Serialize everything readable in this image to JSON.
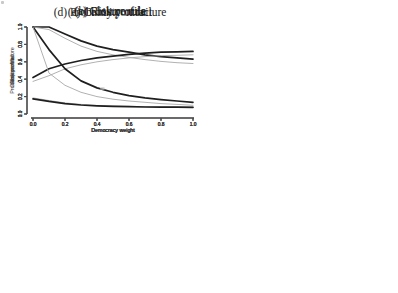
{
  "figure": {
    "background": "#ffffff",
    "axis_color": "#4a4a4a",
    "tick_text_color": "#3d3d3d",
    "title_color": "#1b1b1b",
    "line_colors": {
      "solid_black": "#1f1f1f",
      "thin_gray": "#a8a8a8"
    }
  },
  "chart_data": [
    {
      "type": "line",
      "title": "(a) Closure rule",
      "xlabel": "Democracy weight",
      "ylabel": "Closure rule",
      "xlim": [
        0.0,
        1.0
      ],
      "ylim": [
        0.0,
        1.0
      ],
      "xticks": [
        0.0,
        0.2,
        0.4,
        0.6,
        0.8,
        1.0
      ],
      "yticks": [
        0.0,
        0.2,
        0.4,
        0.6,
        0.8,
        1.0
      ],
      "grid": false,
      "legend": "none",
      "x": [
        0.0,
        0.1,
        0.2,
        0.3,
        0.4,
        0.5,
        0.6,
        0.7,
        0.8,
        0.9,
        1.0
      ],
      "series": [
        {
          "name": "thick-solid",
          "color_key": "solid_black",
          "width": 1.7,
          "values": [
            1.0,
            1.0,
            0.92,
            0.84,
            0.78,
            0.74,
            0.71,
            0.68,
            0.66,
            0.645,
            0.63
          ]
        },
        {
          "name": "thin-gray",
          "color_key": "thin_gray",
          "width": 0.9,
          "values": [
            1.0,
            0.97,
            0.87,
            0.78,
            0.72,
            0.68,
            0.65,
            0.625,
            0.605,
            0.59,
            0.58
          ]
        }
      ]
    },
    {
      "type": "line",
      "title": "(b) Risk profile",
      "xlabel": "Democracy weight",
      "ylabel": "Risk profile",
      "xlim": [
        0.0,
        1.0
      ],
      "ylim": [
        0.0,
        1.0
      ],
      "xticks": [
        0.0,
        0.2,
        0.4,
        0.6,
        0.8,
        1.0
      ],
      "yticks": [
        0.0,
        0.2,
        0.4,
        0.6,
        0.8,
        1.0
      ],
      "grid": false,
      "legend": "none",
      "x": [
        0.0,
        0.1,
        0.2,
        0.3,
        0.4,
        0.5,
        0.6,
        0.7,
        0.8,
        0.9,
        1.0
      ],
      "series": [
        {
          "name": "thick-solid",
          "color_key": "solid_black",
          "width": 1.7,
          "values": [
            0.42,
            0.52,
            0.575,
            0.615,
            0.645,
            0.665,
            0.685,
            0.7,
            0.71,
            0.715,
            0.72
          ]
        },
        {
          "name": "thin-gray",
          "color_key": "thin_gray",
          "width": 0.9,
          "values": [
            0.375,
            0.44,
            0.52,
            0.565,
            0.6,
            0.625,
            0.645,
            0.66,
            0.67,
            0.675,
            0.68
          ]
        }
      ]
    },
    {
      "type": "line",
      "title": "(c) Crony contract",
      "xlabel": "Democracy weight",
      "ylabel": "Crony contract",
      "xlim": [
        0.0,
        1.0
      ],
      "ylim": [
        0.0,
        1.0
      ],
      "xticks": [
        0.0,
        0.2,
        0.4,
        0.6,
        0.8,
        1.0
      ],
      "yticks": [
        0.0,
        0.2,
        0.4,
        0.6,
        0.8,
        1.0
      ],
      "grid": false,
      "legend": "none",
      "x": [
        0.0,
        0.1,
        0.2,
        0.3,
        0.4,
        0.5,
        0.6,
        0.7,
        0.8,
        0.9,
        1.0
      ],
      "series": [
        {
          "name": "thick-solid",
          "color_key": "solid_black",
          "width": 1.7,
          "values": [
            1.0,
            0.74,
            0.52,
            0.38,
            0.3,
            0.25,
            0.21,
            0.185,
            0.165,
            0.15,
            0.135
          ]
        },
        {
          "name": "thin-gray",
          "color_key": "thin_gray",
          "width": 0.9,
          "values": [
            1.0,
            0.47,
            0.33,
            0.25,
            0.2,
            0.17,
            0.15,
            0.135,
            0.12,
            0.11,
            0.1
          ]
        }
      ]
    },
    {
      "type": "line",
      "title": "(d) Probability of failure",
      "xlabel": "Democracy weight",
      "ylabel": "Probability of failure",
      "xlim": [
        0.0,
        1.0
      ],
      "ylim": [
        0.0,
        1.0
      ],
      "xticks": [
        0.0,
        0.2,
        0.4,
        0.6,
        0.8,
        1.0
      ],
      "yticks": [
        0.0,
        0.2,
        0.4,
        0.6,
        0.8,
        1.0
      ],
      "grid": false,
      "legend": "none",
      "x": [
        0.0,
        0.1,
        0.2,
        0.3,
        0.4,
        0.5,
        0.6,
        0.7,
        0.8,
        0.9,
        1.0
      ],
      "series": [
        {
          "name": "thin-gray",
          "color_key": "thin_gray",
          "width": 0.9,
          "values": [
            0.185,
            0.155,
            0.128,
            0.11,
            0.098,
            0.092,
            0.087,
            0.084,
            0.082,
            0.081,
            0.08
          ]
        },
        {
          "name": "thick-solid",
          "color_key": "solid_black",
          "width": 1.7,
          "values": [
            0.175,
            0.145,
            0.12,
            0.103,
            0.094,
            0.088,
            0.084,
            0.081,
            0.079,
            0.078,
            0.077
          ]
        }
      ]
    }
  ]
}
